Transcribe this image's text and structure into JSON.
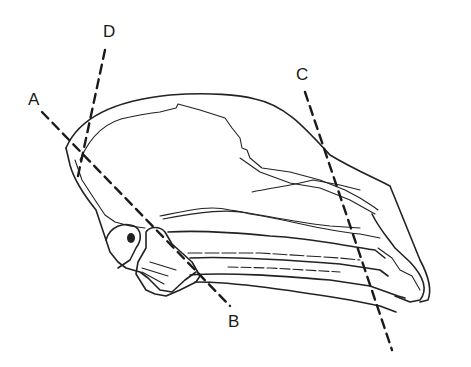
{
  "figure": {
    "labels": [
      {
        "id": "A",
        "text": "A",
        "x": 28,
        "y": 91
      },
      {
        "id": "B",
        "text": "B",
        "x": 228,
        "y": 313
      },
      {
        "id": "C",
        "text": "C",
        "x": 296,
        "y": 66
      },
      {
        "id": "D",
        "text": "D",
        "x": 103,
        "y": 23
      }
    ],
    "cut_lines": [
      {
        "id": "A-B",
        "from": "A",
        "to": "B"
      },
      {
        "id": "C",
        "from": "C",
        "to": "bottom"
      },
      {
        "id": "D",
        "from": "D",
        "to": "back of skull"
      }
    ],
    "colors": {
      "line": "#222222",
      "background": "#ffffff"
    }
  }
}
